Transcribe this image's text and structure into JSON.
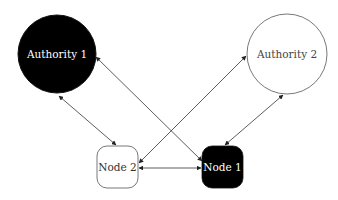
{
  "diagram": {
    "nodes": [
      {
        "id": "authority1",
        "label": "Authority 1",
        "shape": "circle",
        "fill": "#000000",
        "text_color": "#ffffff",
        "cx": 57,
        "cy": 54,
        "r": 39
      },
      {
        "id": "authority2",
        "label": "Authority 2",
        "shape": "circle",
        "fill": "#ffffff",
        "text_color": "#444444",
        "cx": 287,
        "cy": 54,
        "r": 40
      },
      {
        "id": "node2",
        "label": "Node 2",
        "shape": "rounded-square",
        "fill": "#ffffff",
        "text_color": "#333333",
        "x": 97,
        "y": 146,
        "w": 41,
        "h": 42
      },
      {
        "id": "node1",
        "label": "Node 1",
        "shape": "rounded-square",
        "fill": "#000000",
        "text_color": "#ffffff",
        "x": 202,
        "y": 146,
        "w": 41,
        "h": 42
      }
    ],
    "edges": [
      {
        "from": "authority1",
        "to": "node2",
        "direction": "both"
      },
      {
        "from": "authority1",
        "to": "node1",
        "direction": "both"
      },
      {
        "from": "node2",
        "to": "authority2",
        "direction": "both"
      },
      {
        "from": "authority2",
        "to": "node1",
        "direction": "both"
      },
      {
        "from": "node2",
        "to": "node1",
        "direction": "both"
      }
    ],
    "colors": {
      "line": "#333333",
      "outline": "#555555"
    }
  }
}
